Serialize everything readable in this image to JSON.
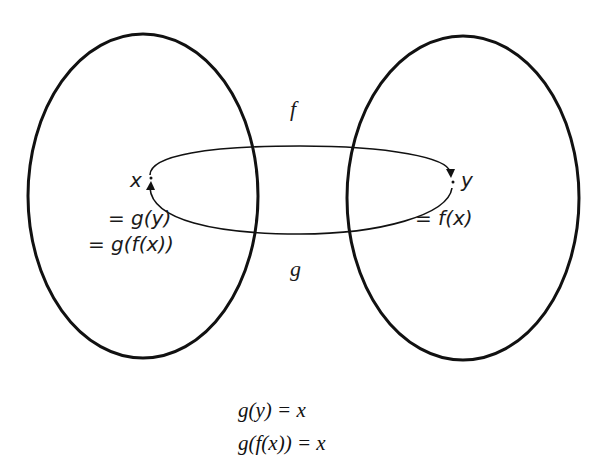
{
  "diagram": {
    "type": "function-inverse-mapping",
    "sets": [
      {
        "name": "domain-set",
        "shape": "ellipse"
      },
      {
        "name": "codomain-set",
        "shape": "ellipse"
      }
    ],
    "arrows": [
      {
        "label": "f",
        "from": "x",
        "to": "y",
        "direction": "left-to-right (top arc)"
      },
      {
        "label": "g",
        "from": "y",
        "to": "x",
        "direction": "right-to-left (bottom arc)"
      }
    ],
    "labels": {
      "f": "f",
      "g": "g",
      "x": "x",
      "y": "y",
      "x_eq1": "= g(y)",
      "x_eq2": "= g(f(x))",
      "y_eq1": "= f(x)"
    },
    "colors": {
      "stroke": "#111111",
      "background": "#ffffff"
    }
  },
  "equations": [
    "g(y) = x",
    "g(f(x)) = x"
  ]
}
